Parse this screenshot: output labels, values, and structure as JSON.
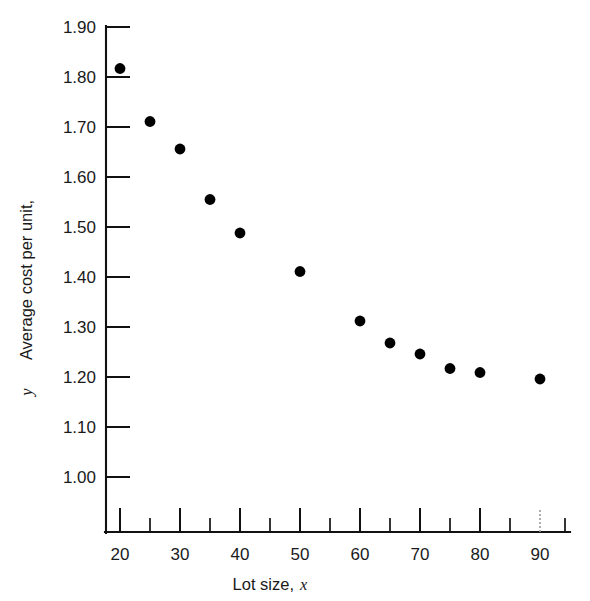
{
  "chart_data": {
    "type": "scatter",
    "title": "",
    "xlabel": "Lot size, x",
    "xlabel_text": "Lot size,",
    "xlabel_var": "x",
    "ylabel": "Average cost per unit, y",
    "ylabel_text": "Average cost per unit,",
    "ylabel_var": "y",
    "x": [
      20,
      25,
      30,
      35,
      40,
      50,
      60,
      65,
      70,
      75,
      80,
      90
    ],
    "y": [
      1.817,
      1.711,
      1.656,
      1.555,
      1.488,
      1.411,
      1.312,
      1.268,
      1.246,
      1.217,
      1.209,
      1.196
    ],
    "points": [
      {
        "x": 20,
        "y": 1.817
      },
      {
        "x": 25,
        "y": 1.711
      },
      {
        "x": 30,
        "y": 1.656
      },
      {
        "x": 35,
        "y": 1.555
      },
      {
        "x": 40,
        "y": 1.488
      },
      {
        "x": 50,
        "y": 1.411
      },
      {
        "x": 60,
        "y": 1.312
      },
      {
        "x": 65,
        "y": 1.268
      },
      {
        "x": 70,
        "y": 1.246
      },
      {
        "x": 75,
        "y": 1.217
      },
      {
        "x": 80,
        "y": 1.209
      },
      {
        "x": 90,
        "y": 1.196
      }
    ],
    "xlim": [
      15,
      98
    ],
    "ylim": [
      0.96,
      1.9
    ],
    "xticks_major": [
      20,
      30,
      40,
      50,
      60,
      70,
      80,
      90
    ],
    "xticks_minor": [
      25,
      35,
      45,
      55,
      65,
      75,
      85,
      95
    ],
    "xtick_labels": [
      "20",
      "30",
      "40",
      "50",
      "60",
      "70",
      "80",
      "90"
    ],
    "yticks": [
      1.0,
      1.1,
      1.2,
      1.3,
      1.4,
      1.5,
      1.6,
      1.7,
      1.8,
      1.9
    ],
    "ytick_labels": [
      "1.00",
      "1.10",
      "1.20",
      "1.30",
      "1.40",
      "1.50",
      "1.60",
      "1.70",
      "1.80",
      "1.90"
    ],
    "grid": false,
    "legend": false,
    "marker": "filled-circle",
    "marker_color": "#000000",
    "axis_color": "#111111",
    "background": "#ffffff"
  }
}
